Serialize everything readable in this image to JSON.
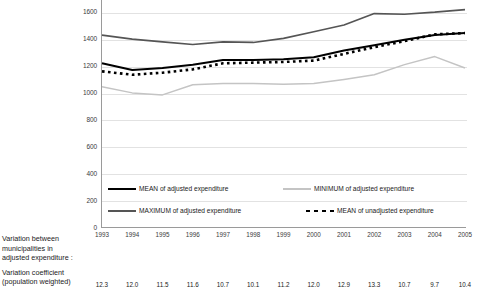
{
  "chart_data": {
    "type": "line",
    "title": "",
    "xlabel": "",
    "ylabel": "",
    "categories": [
      "1993",
      "1994",
      "1995",
      "1996",
      "1997",
      "1998",
      "1999",
      "2000",
      "2001",
      "2002",
      "2003",
      "2004",
      "2005"
    ],
    "ylim": [
      0,
      1800
    ],
    "yticks": [
      0,
      200,
      400,
      600,
      800,
      1000,
      1200,
      1400,
      1600
    ],
    "ytick_labels": [
      "0",
      "200",
      "400",
      "600",
      "800",
      "1000",
      "1200",
      "1400",
      "1600"
    ],
    "grid": true,
    "legend_position": "inside-bottom-left",
    "series": [
      {
        "name": "MEAN of adjusted expenditure",
        "style": "solid",
        "color": "#000000",
        "values": [
          1225,
          1175,
          1190,
          1215,
          1250,
          1250,
          1255,
          1270,
          1320,
          1360,
          1400,
          1435,
          1450
        ]
      },
      {
        "name": "MAXIMUM of adjusted expenditure",
        "style": "solid",
        "color": "#555555",
        "values": [
          1435,
          1405,
          1385,
          1365,
          1385,
          1380,
          1410,
          1460,
          1510,
          1595,
          1590,
          1605,
          1625
        ]
      },
      {
        "name": "MINIMUM of adjusted expenditure",
        "style": "solid",
        "color": "#c4c4c4",
        "values": [
          1050,
          1005,
          990,
          1065,
          1075,
          1075,
          1070,
          1075,
          1105,
          1140,
          1215,
          1275,
          1190
        ]
      },
      {
        "name": "MEAN of unadjusted expenditure",
        "style": "dotted",
        "color": "#000000",
        "values": [
          1165,
          1140,
          1155,
          1180,
          1225,
          1230,
          1235,
          1245,
          1295,
          1345,
          1390,
          1440,
          1450
        ]
      }
    ]
  },
  "legend": {
    "mean_adjusted": "MEAN of adjusted expenditure",
    "minimum_adjusted": "MINIMUM of adjusted expenditure",
    "maximum_adjusted": "MAXIMUM of adjusted expenditure",
    "mean_unadjusted": "MEAN of unadjusted expenditure"
  },
  "footer": {
    "block1_line1": "Variation between",
    "block1_line2": "municipalities in",
    "block1_line3": "adjusted expenditure :",
    "block2_line1": "Variation coefficient",
    "block2_line2": "(population weighted)",
    "coefficients": [
      "12.3",
      "12.0",
      "11.5",
      "11.6",
      "10.7",
      "10.1",
      "11.2",
      "12.0",
      "12.9",
      "13.3",
      "10.7",
      "9.7",
      "10.4"
    ]
  },
  "colors": {
    "mean": "#000000",
    "maximum": "#555555",
    "minimum": "#c4c4c4",
    "grid": "#e2e2e2",
    "axis": "#9a9a9a"
  }
}
